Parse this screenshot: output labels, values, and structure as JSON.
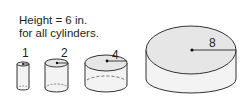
{
  "caption": {
    "line1": "Height = 6 in.",
    "line2": "for all cylinders."
  },
  "cylinders": [
    {
      "label": "1",
      "radius": 1
    },
    {
      "label": "2",
      "radius": 2
    },
    {
      "label": "4",
      "radius": 4
    },
    {
      "label": "8",
      "radius": 8
    }
  ],
  "colors": {
    "stroke": "#333333",
    "top_fill": "#e6e6e6",
    "side_fill": "#f3f3f3"
  }
}
